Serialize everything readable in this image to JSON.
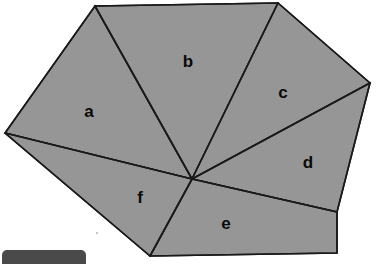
{
  "canvas": {
    "width": 376,
    "height": 262,
    "background": "#ffffff"
  },
  "figure": {
    "fill_color": "#969696",
    "stroke_color": "#1a1a1a",
    "stroke_width": 1.6,
    "center_point": {
      "x": 192,
      "y": 179
    },
    "outline_vertices": [
      {
        "x": 95,
        "y": 6
      },
      {
        "x": 278,
        "y": 3
      },
      {
        "x": 370,
        "y": 83
      },
      {
        "x": 337,
        "y": 212
      },
      {
        "x": 337,
        "y": 253
      },
      {
        "x": 150,
        "y": 256
      },
      {
        "x": 5,
        "y": 133
      }
    ],
    "regions": [
      {
        "label": "a",
        "label_x": 89,
        "label_y": 113,
        "points": "5,133 95,6 192,179"
      },
      {
        "label": "b",
        "label_x": 188,
        "label_y": 63,
        "points": "95,6 278,3 192,179"
      },
      {
        "label": "c",
        "label_x": 283,
        "label_y": 94,
        "points": "278,3 370,83 192,179"
      },
      {
        "label": "d",
        "label_x": 308,
        "label_y": 164,
        "points": "370,83 337,212 192,179"
      },
      {
        "label": "e",
        "label_x": 226,
        "label_y": 225,
        "points": "337,212 337,253 150,256 192,179"
      },
      {
        "label": "f",
        "label_x": 140,
        "label_y": 199,
        "points": "150,256 5,133 192,179"
      }
    ],
    "divider_lines": [
      {
        "from": "center",
        "to_x": 95,
        "to_y": 6
      },
      {
        "from": "center",
        "to_x": 278,
        "to_y": 3
      },
      {
        "from": "center",
        "to_x": 370,
        "to_y": 83
      },
      {
        "from": "center",
        "to_x": 337,
        "to_y": 212
      },
      {
        "from": "center",
        "to_x": 150,
        "to_y": 256
      },
      {
        "from": "center",
        "to_x": 5,
        "to_y": 133
      }
    ]
  },
  "overlay": {
    "taskbar_chip_color": "#4a4a4a"
  }
}
